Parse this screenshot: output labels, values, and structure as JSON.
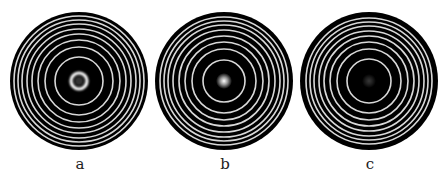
{
  "figure": {
    "background": "#ffffff",
    "disk_color": "#000000",
    "ring_color": "#d8d8d8",
    "ring_width": 1.6,
    "panels": [
      {
        "label": "a",
        "cx": 79,
        "cy": 81,
        "r": 69,
        "label_x": 80,
        "label_y": 157,
        "rings": [
          24,
          34,
          41,
          47,
          52,
          57,
          61,
          65
        ],
        "center_spot": {
          "type": "ring",
          "radius": 8,
          "width": 3.2,
          "peak": 1.0
        }
      },
      {
        "label": "b",
        "cx": 224,
        "cy": 81,
        "r": 69,
        "label_x": 225,
        "label_y": 157,
        "rings": [
          21,
          32,
          39,
          45,
          51,
          56,
          60,
          64
        ],
        "center_spot": {
          "type": "gaussian",
          "radius": 8,
          "peak": 1.0
        }
      },
      {
        "label": "c",
        "cx": 369,
        "cy": 81,
        "r": 69,
        "label_x": 370,
        "label_y": 157,
        "rings": [
          22,
          32,
          39,
          45,
          50,
          55,
          59,
          63
        ],
        "center_spot": {
          "type": "gaussian",
          "radius": 7,
          "peak": 0.22
        }
      }
    ]
  }
}
